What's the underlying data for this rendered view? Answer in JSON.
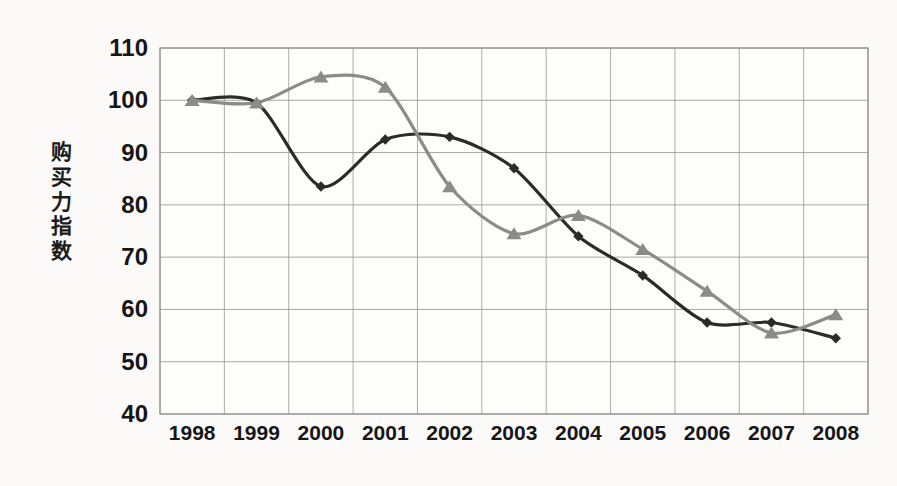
{
  "chart_data": {
    "type": "line",
    "title": "",
    "xlabel": "",
    "ylabel": "购买力指数",
    "ylabel_chars": [
      "购",
      "买",
      "力",
      "指",
      "数"
    ],
    "categories": [
      "1998",
      "1999",
      "2000",
      "2001",
      "2002",
      "2003",
      "2004",
      "2005",
      "2006",
      "2007",
      "2008"
    ],
    "x": [
      1998,
      1999,
      2000,
      2001,
      2002,
      2003,
      2004,
      2005,
      2006,
      2007,
      2008
    ],
    "ylim": [
      40,
      110
    ],
    "yticks": [
      110,
      100,
      90,
      80,
      70,
      60,
      50,
      40
    ],
    "grid": true,
    "legend": "none",
    "series": [
      {
        "name": "series-dark",
        "color": "#2b2b2b",
        "marker": "diamond",
        "values": [
          100,
          99.5,
          83.5,
          92.5,
          93,
          87,
          74,
          66.5,
          57.5,
          57.5,
          54.5
        ]
      },
      {
        "name": "series-gray",
        "color": "#8b8b8b",
        "marker": "triangle",
        "values": [
          100,
          99.5,
          104.5,
          102.5,
          83.5,
          74.5,
          78,
          71.5,
          63.5,
          55.5,
          59
        ]
      }
    ]
  },
  "plot": {
    "left": 160,
    "right": 868,
    "top": 48,
    "bottom": 414,
    "background": "#fdfdfb",
    "gridline_color": "#9a9a9a",
    "frame_color": "#8f8f8f"
  }
}
